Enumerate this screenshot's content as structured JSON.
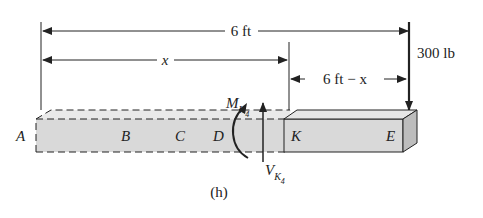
{
  "figure": {
    "caption": "(h)",
    "dimensions": {
      "total_length": "6 ft",
      "section_length": "x",
      "remaining_length": "6 ft − x"
    },
    "load": {
      "value": "300 lb",
      "point": "E",
      "direction": "down"
    },
    "points": [
      "A",
      "B",
      "C",
      "D",
      "K",
      "E"
    ],
    "internal_forces": {
      "moment": {
        "symbol": "M",
        "subscript": "K",
        "subsub": "4"
      },
      "shear": {
        "symbol": "V",
        "subscript": "K",
        "subsub": "4"
      }
    },
    "colors": {
      "beam_fill": "#d9d9d9",
      "beam_top": "#e6e6e6",
      "beam_side": "#bdbdbd",
      "line": "#222222"
    }
  }
}
